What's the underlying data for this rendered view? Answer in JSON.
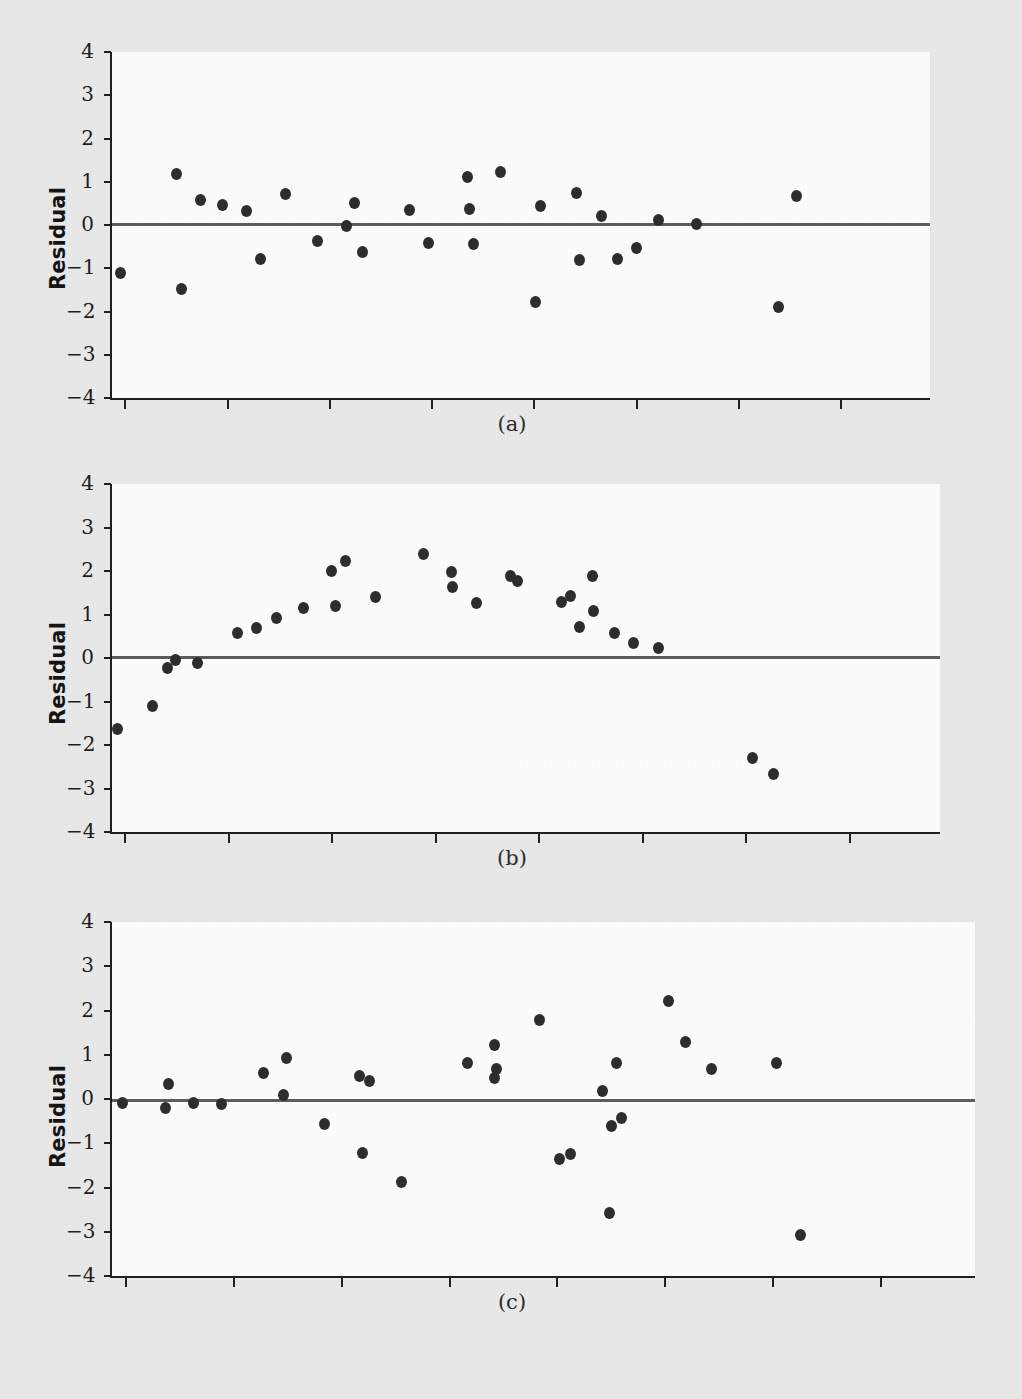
{
  "figure": {
    "y_axis_label": "Residual",
    "y_ticks": [
      "4",
      "3",
      "2",
      "1",
      "0",
      "−1",
      "−2",
      "−3",
      "−4"
    ],
    "captions": {
      "a": "(a)",
      "b": "(b)",
      "c": "(c)"
    },
    "colors": {
      "background": "#e9e9e9",
      "plot_background": "#fdfdfd",
      "axis": "#1d1d1d",
      "zero_line": "#5a5a5a",
      "marker": "#2b2b2b",
      "text": "#1a1a1a"
    }
  },
  "chart_data": [
    {
      "type": "scatter",
      "panel": "(a)",
      "title": "",
      "xlabel": "",
      "ylabel": "Residual",
      "ylim": [
        -4,
        4
      ],
      "xlim": [
        0,
        30
      ],
      "yticks": [
        4,
        3,
        2,
        1,
        0,
        -1,
        -2,
        -3,
        -4
      ],
      "xticks_labeled": false,
      "n_xticks": 7,
      "grid": false,
      "legend": "none",
      "annotations": [
        "horizontal reference line at y = 0"
      ],
      "points": [
        {
          "x": 0.3,
          "y": -1.12
        },
        {
          "x": 2.35,
          "y": 1.17
        },
        {
          "x": 2.55,
          "y": -1.48
        },
        {
          "x": 3.25,
          "y": 0.58
        },
        {
          "x": 4.05,
          "y": 0.47
        },
        {
          "x": 4.95,
          "y": 0.32
        },
        {
          "x": 5.45,
          "y": -0.78
        },
        {
          "x": 6.35,
          "y": 0.72
        },
        {
          "x": 7.55,
          "y": -0.36
        },
        {
          "x": 8.6,
          "y": -0.02
        },
        {
          "x": 8.9,
          "y": 0.52
        },
        {
          "x": 9.2,
          "y": -0.62
        },
        {
          "x": 10.9,
          "y": 0.34
        },
        {
          "x": 11.6,
          "y": -0.42
        },
        {
          "x": 13.05,
          "y": 1.12
        },
        {
          "x": 13.1,
          "y": 0.38
        },
        {
          "x": 13.25,
          "y": -0.45
        },
        {
          "x": 14.25,
          "y": 1.23
        },
        {
          "x": 15.7,
          "y": 0.43
        },
        {
          "x": 15.55,
          "y": -1.78
        },
        {
          "x": 17.05,
          "y": 0.73
        },
        {
          "x": 17.15,
          "y": -0.82
        },
        {
          "x": 17.95,
          "y": 0.2
        },
        {
          "x": 18.55,
          "y": -0.78
        },
        {
          "x": 19.25,
          "y": -0.54
        },
        {
          "x": 20.05,
          "y": 0.12
        },
        {
          "x": 21.45,
          "y": 0.02
        },
        {
          "x": 25.1,
          "y": 0.67
        },
        {
          "x": 24.45,
          "y": -1.9
        }
      ]
    },
    {
      "type": "scatter",
      "panel": "(b)",
      "title": "",
      "xlabel": "",
      "ylabel": "Residual",
      "ylim": [
        -4,
        4
      ],
      "xlim": [
        0,
        30
      ],
      "yticks": [
        4,
        3,
        2,
        1,
        0,
        -1,
        -2,
        -3,
        -4
      ],
      "xticks_labeled": false,
      "n_xticks": 7,
      "grid": false,
      "legend": "none",
      "annotations": [
        "horizontal reference line at y = 0",
        "inverted-U (curvature) pattern in residuals"
      ],
      "points": [
        {
          "x": 0.2,
          "y": -1.63
        },
        {
          "x": 1.45,
          "y": -1.1
        },
        {
          "x": 2.0,
          "y": -0.22
        },
        {
          "x": 2.3,
          "y": -0.04
        },
        {
          "x": 3.1,
          "y": -0.11
        },
        {
          "x": 4.55,
          "y": 0.57
        },
        {
          "x": 5.25,
          "y": 0.7
        },
        {
          "x": 5.95,
          "y": 0.92
        },
        {
          "x": 6.95,
          "y": 1.16
        },
        {
          "x": 7.95,
          "y": 2.0
        },
        {
          "x": 8.45,
          "y": 2.23
        },
        {
          "x": 8.1,
          "y": 1.2
        },
        {
          "x": 9.55,
          "y": 1.41
        },
        {
          "x": 11.3,
          "y": 2.38
        },
        {
          "x": 12.3,
          "y": 1.97
        },
        {
          "x": 12.35,
          "y": 1.64
        },
        {
          "x": 13.2,
          "y": 1.26
        },
        {
          "x": 14.45,
          "y": 1.88
        },
        {
          "x": 14.7,
          "y": 1.76
        },
        {
          "x": 16.3,
          "y": 1.28
        },
        {
          "x": 16.6,
          "y": 1.42
        },
        {
          "x": 17.4,
          "y": 1.89
        },
        {
          "x": 17.45,
          "y": 1.07
        },
        {
          "x": 16.95,
          "y": 0.72
        },
        {
          "x": 18.2,
          "y": 0.57
        },
        {
          "x": 18.9,
          "y": 0.35
        },
        {
          "x": 19.8,
          "y": 0.24
        },
        {
          "x": 23.2,
          "y": -2.3
        },
        {
          "x": 23.95,
          "y": -2.67
        }
      ]
    },
    {
      "type": "scatter",
      "panel": "(c)",
      "title": "",
      "xlabel": "",
      "ylabel": "Residual",
      "ylim": [
        -4,
        4
      ],
      "xlim": [
        0,
        30
      ],
      "yticks": [
        4,
        3,
        2,
        1,
        0,
        -1,
        -2,
        -3,
        -4
      ],
      "xticks_labeled": false,
      "n_xticks": 7,
      "grid": false,
      "legend": "none",
      "annotations": [
        "horizontal reference line at y = 0",
        "increasing spread (megaphone) pattern"
      ],
      "points": [
        {
          "x": 0.35,
          "y": -0.08
        },
        {
          "x": 1.95,
          "y": 0.33
        },
        {
          "x": 1.85,
          "y": -0.2
        },
        {
          "x": 2.85,
          "y": -0.1
        },
        {
          "x": 3.8,
          "y": -0.12
        },
        {
          "x": 5.25,
          "y": 0.59
        },
        {
          "x": 6.05,
          "y": 0.93
        },
        {
          "x": 5.95,
          "y": 0.1
        },
        {
          "x": 7.4,
          "y": -0.57
        },
        {
          "x": 8.6,
          "y": 0.51
        },
        {
          "x": 8.95,
          "y": 0.41
        },
        {
          "x": 8.7,
          "y": -1.22
        },
        {
          "x": 10.05,
          "y": -1.87
        },
        {
          "x": 12.35,
          "y": 0.81
        },
        {
          "x": 13.3,
          "y": 1.23
        },
        {
          "x": 13.35,
          "y": 0.67
        },
        {
          "x": 13.3,
          "y": 0.48
        },
        {
          "x": 14.85,
          "y": 1.79
        },
        {
          "x": 15.55,
          "y": -1.35
        },
        {
          "x": 15.95,
          "y": -1.25
        },
        {
          "x": 17.05,
          "y": 0.18
        },
        {
          "x": 17.7,
          "y": -0.42
        },
        {
          "x": 17.35,
          "y": -0.62
        },
        {
          "x": 17.55,
          "y": 0.81
        },
        {
          "x": 17.3,
          "y": -2.57
        },
        {
          "x": 19.35,
          "y": 2.22
        },
        {
          "x": 19.95,
          "y": 1.29
        },
        {
          "x": 20.85,
          "y": 0.67
        },
        {
          "x": 23.1,
          "y": 0.82
        },
        {
          "x": 23.95,
          "y": -3.07
        }
      ]
    }
  ]
}
